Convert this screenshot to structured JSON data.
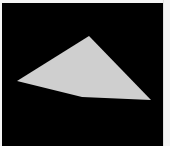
{
  "canvas": {
    "background": "#000000",
    "shape": {
      "type": "quadrilateral",
      "fill": "#cfcfcf",
      "points": [
        [
          87,
          33
        ],
        [
          15,
          78
        ],
        [
          80,
          94
        ],
        [
          149,
          97
        ]
      ]
    }
  },
  "frame": {
    "background": "#f4f4f4"
  }
}
